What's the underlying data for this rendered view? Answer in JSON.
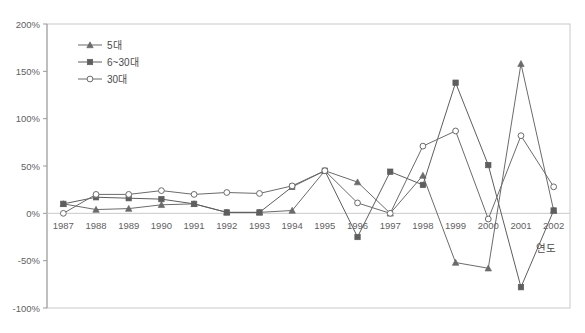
{
  "chart_data": {
    "type": "line",
    "title": "",
    "subtitle": "",
    "xlabel": "연도",
    "ylabel": "",
    "categories": [
      "1987",
      "1988",
      "1989",
      "1990",
      "1991",
      "1992",
      "1993",
      "1994",
      "1995",
      "1996",
      "1997",
      "1998",
      "1999",
      "2000",
      "2001",
      "2002"
    ],
    "ylim": [
      -100,
      200
    ],
    "ytick_labels": [
      "200%",
      "150%",
      "100%",
      "50%",
      "0%",
      "-50%",
      "-100%"
    ],
    "ytick_values": [
      200,
      150,
      100,
      50,
      0,
      -50,
      -100
    ],
    "grid": false,
    "legend_position": "top-left",
    "series": [
      {
        "name": "5대",
        "marker": "triangle",
        "color": "#6b6b6b",
        "values": [
          10,
          4,
          5,
          9,
          10,
          1,
          1,
          3,
          45,
          33,
          0,
          40,
          -52,
          -58,
          158,
          3
        ]
      },
      {
        "name": "6~30대",
        "marker": "square-filled",
        "color": "#5e5e5e",
        "values": [
          10,
          17,
          16,
          15,
          10,
          1,
          1,
          28,
          45,
          -25,
          44,
          30,
          138,
          51,
          -78,
          3
        ]
      },
      {
        "name": "30대",
        "marker": "circle-open",
        "color": "#6b6b6b",
        "values": [
          0,
          20,
          20,
          24,
          20,
          22,
          21,
          29,
          45,
          11,
          0,
          71,
          87,
          -6,
          82,
          28
        ]
      }
    ]
  },
  "axis": {
    "x_title": "연도"
  },
  "colors": {
    "frame": "#c9c9c9",
    "axis": "#9a9a9a",
    "text": "#5a5a5a",
    "series_1": "#6b6b6b",
    "series_2": "#5e5e5e",
    "series_3": "#6b6b6b"
  }
}
